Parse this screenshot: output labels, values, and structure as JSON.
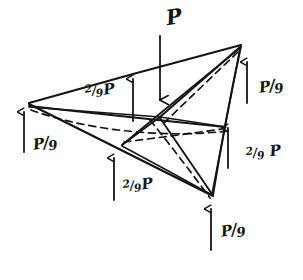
{
  "figure": {
    "ink_color": "#151515",
    "background_color": "#ffffff",
    "applied_load": {
      "name": "applied-load-P",
      "label": "P",
      "direction": "down"
    },
    "reactions": [
      {
        "name": "reaction-top-left",
        "label": "2/9 P",
        "numerator": "2",
        "denominator": "9",
        "force": "P",
        "direction": "up"
      },
      {
        "name": "reaction-top-right",
        "label": "P/9",
        "numerator": "P",
        "denominator": "9",
        "force": "P",
        "direction": "up"
      },
      {
        "name": "reaction-left",
        "label": "P/9",
        "numerator": "P",
        "denominator": "9",
        "force": "P",
        "direction": "up"
      },
      {
        "name": "reaction-right",
        "label": "2/9 P",
        "numerator": "2",
        "denominator": "9",
        "force": "P",
        "direction": "up"
      },
      {
        "name": "reaction-bottom-left",
        "label": "2/9 P",
        "numerator": "2",
        "denominator": "9",
        "force": "P",
        "direction": "up"
      },
      {
        "name": "reaction-bottom-right",
        "label": "P/9",
        "numerator": "P",
        "denominator": "9",
        "force": "P",
        "direction": "up"
      }
    ],
    "labels": {
      "load_P": "P",
      "two_ninths_P": "2/9 P",
      "P_over_9": "P/9",
      "num_two": "2",
      "num_P": "P",
      "den_nine": "9",
      "slash": "/",
      "force_P": "P"
    }
  }
}
